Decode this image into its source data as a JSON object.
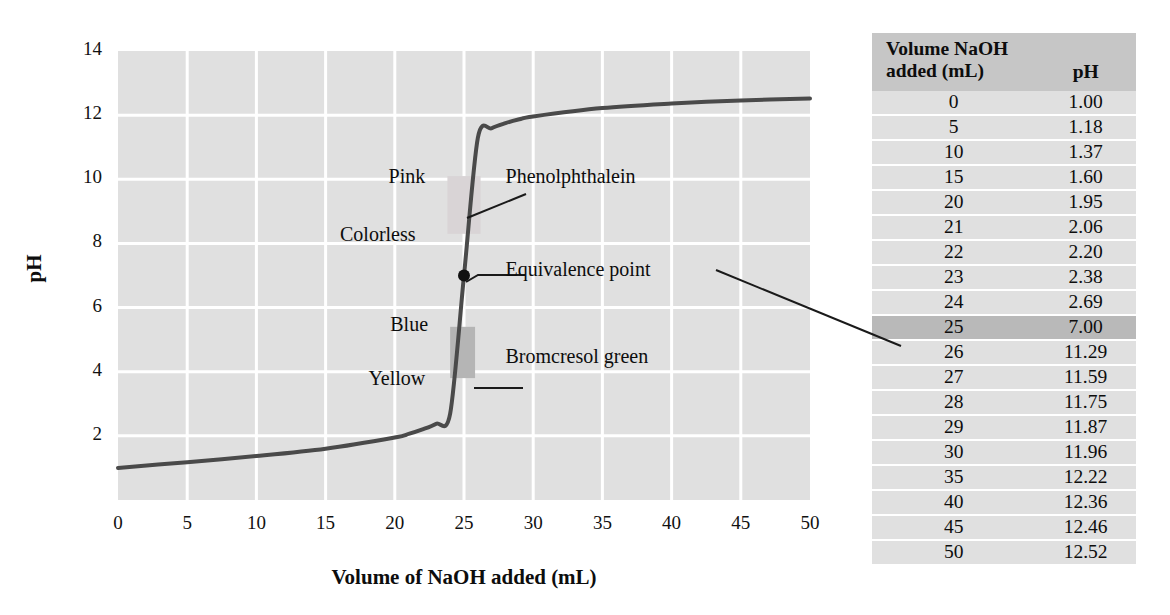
{
  "chart_data": {
    "type": "line",
    "title": "",
    "xlabel": "Volume of NaOH added (mL)",
    "ylabel": "pH",
    "xlim": [
      0,
      50
    ],
    "ylim": [
      0,
      14
    ],
    "grid": true,
    "legend": "none",
    "x_ticks": [
      "0",
      "5",
      "10",
      "15",
      "20",
      "25",
      "30",
      "35",
      "40",
      "45",
      "50"
    ],
    "y_ticks": [
      "2",
      "4",
      "6",
      "8",
      "10",
      "12",
      "14"
    ],
    "series": [
      {
        "name": "Titration curve",
        "color": "#4a4a4a",
        "x": [
          0,
          5,
          10,
          15,
          20,
          21,
          22,
          23,
          24,
          25,
          26,
          27,
          28,
          29,
          30,
          35,
          40,
          45,
          50
        ],
        "values": [
          1.0,
          1.18,
          1.37,
          1.6,
          1.95,
          2.06,
          2.2,
          2.38,
          2.69,
          7.0,
          11.29,
          11.59,
          11.75,
          11.87,
          11.96,
          12.22,
          12.36,
          12.46,
          12.52
        ]
      }
    ],
    "markers": [
      {
        "name": "equivalence-point",
        "x": 25,
        "y": 7.0,
        "color": "#111111"
      }
    ],
    "annotations": [
      {
        "name": "pink",
        "text": "Pink",
        "x": 22.2,
        "y": 10.0
      },
      {
        "name": "colorless",
        "text": "Colorless",
        "x": 21.5,
        "y": 8.2
      },
      {
        "name": "phenolphthalein",
        "text": "Phenolphthalein",
        "x": 28.0,
        "y": 10.0
      },
      {
        "name": "equivalence-point",
        "text": "Equivalence point",
        "x": 28.0,
        "y": 7.1
      },
      {
        "name": "blue",
        "text": "Blue",
        "x": 22.4,
        "y": 5.4
      },
      {
        "name": "yellow",
        "text": "Yellow",
        "x": 22.2,
        "y": 3.7
      },
      {
        "name": "bromcresol-green",
        "text": "Bromcresol green",
        "x": 28.0,
        "y": 4.4
      }
    ],
    "indicator_bands": [
      {
        "name": "phenolphthalein-band",
        "x_range": [
          23.8,
          26.2
        ],
        "y_range": [
          8.3,
          10.1
        ],
        "color": "#d9d4d6"
      },
      {
        "name": "bromcresol-green-band",
        "x_range": [
          24.0,
          25.8
        ],
        "y_range": [
          3.8,
          5.4
        ],
        "color": "#b5b5b5"
      }
    ]
  },
  "table": {
    "headers": {
      "volume": "Volume NaOH\nadded (mL)",
      "volume_line1": "Volume NaOH",
      "volume_line2": "added (mL)",
      "ph": "pH"
    },
    "highlight_volume": "25",
    "rows": [
      {
        "volume": "0",
        "ph": "1.00",
        "highlight": false
      },
      {
        "volume": "5",
        "ph": "1.18",
        "highlight": false
      },
      {
        "volume": "10",
        "ph": "1.37",
        "highlight": false
      },
      {
        "volume": "15",
        "ph": "1.60",
        "highlight": false
      },
      {
        "volume": "20",
        "ph": "1.95",
        "highlight": false
      },
      {
        "volume": "21",
        "ph": "2.06",
        "highlight": false
      },
      {
        "volume": "22",
        "ph": "2.20",
        "highlight": false
      },
      {
        "volume": "23",
        "ph": "2.38",
        "highlight": false
      },
      {
        "volume": "24",
        "ph": "2.69",
        "highlight": false
      },
      {
        "volume": "25",
        "ph": "7.00",
        "highlight": true
      },
      {
        "volume": "26",
        "ph": "11.29",
        "highlight": false
      },
      {
        "volume": "27",
        "ph": "11.59",
        "highlight": false
      },
      {
        "volume": "28",
        "ph": "11.75",
        "highlight": false
      },
      {
        "volume": "29",
        "ph": "11.87",
        "highlight": false
      },
      {
        "volume": "30",
        "ph": "11.96",
        "highlight": false
      },
      {
        "volume": "35",
        "ph": "12.22",
        "highlight": false
      },
      {
        "volume": "40",
        "ph": "12.36",
        "highlight": false
      },
      {
        "volume": "45",
        "ph": "12.46",
        "highlight": false
      },
      {
        "volume": "50",
        "ph": "12.52",
        "highlight": false
      }
    ]
  },
  "colors": {
    "plot_background": "#e0e0e0",
    "gridline": "#ffffff",
    "curve": "#4a4a4a",
    "table_header": "#c6c6c6",
    "table_row": "#e0e0e0",
    "table_highlight": "#b9b9b9",
    "leader_line": "#1a1a1a"
  }
}
